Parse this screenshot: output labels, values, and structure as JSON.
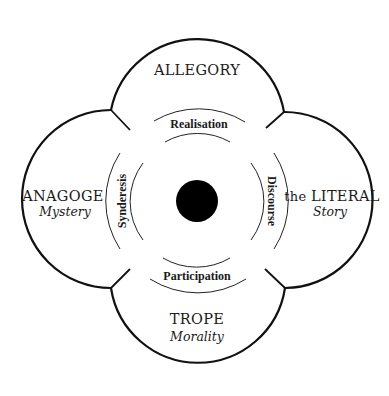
{
  "diagram": {
    "lobes": {
      "top": {
        "title": "ALLEGORY",
        "subtitle": ""
      },
      "left": {
        "title": "ANAGOGE",
        "subtitle": "Mystery"
      },
      "right": {
        "title_prefix": "the ",
        "title": "LITERAL",
        "subtitle": "Story"
      },
      "bottom": {
        "title": "TROPE",
        "subtitle": "Morality"
      }
    },
    "ring_labels": {
      "top": "Realisation",
      "left": "Synderesis",
      "right": "Discourse",
      "bottom": "Participation"
    },
    "center": {
      "shape": "filled-circle",
      "color": "#000000"
    },
    "colors": {
      "stroke": "#111111",
      "background": "#ffffff"
    }
  }
}
